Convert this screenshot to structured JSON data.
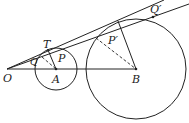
{
  "figure": {
    "type": "geometry-diagram",
    "points": {
      "O": {
        "label": "O"
      },
      "A": {
        "label": "A"
      },
      "B": {
        "label": "B"
      },
      "T": {
        "label": "T"
      },
      "P": {
        "label": "P"
      },
      "Q": {
        "label": "Q"
      },
      "P_prime": {
        "label": "P′"
      },
      "Q_prime": {
        "label": "Q′"
      }
    },
    "elements": [
      {
        "name": "circle-A",
        "kind": "circle",
        "center": "A"
      },
      {
        "name": "circle-B",
        "kind": "circle",
        "center": "B"
      },
      {
        "name": "line-OB",
        "kind": "segment",
        "from": "O",
        "to": "B"
      },
      {
        "name": "tangent-line",
        "kind": "line",
        "through": [
          "O",
          "T"
        ]
      },
      {
        "name": "secant-line",
        "kind": "line",
        "through": [
          "O",
          "Q_prime"
        ]
      },
      {
        "name": "radius-AT",
        "kind": "segment",
        "from": "T",
        "to": "A"
      },
      {
        "name": "radius-B-tangent",
        "kind": "segment",
        "from": "tangent point on B",
        "to": "B"
      },
      {
        "name": "dashed-QA",
        "kind": "dashed-segment",
        "from": "Q",
        "to": "A"
      },
      {
        "name": "dashed-P'B",
        "kind": "dashed-segment",
        "from": "P_prime",
        "to": "B"
      }
    ]
  }
}
